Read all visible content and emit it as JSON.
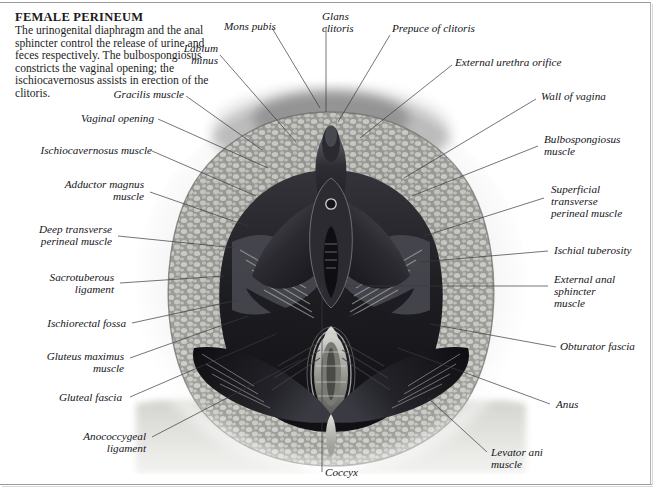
{
  "document": {
    "title": "FEMALE PERINEUM",
    "description": "The urinogenital diaphragm and the anal sphincter control the release of urine and feces respectively. The bulbospongiosus constricts the vaginal opening; the ischiocavernosus assists in erection of the clitoris."
  },
  "illustration": {
    "name": "female-perineum-anatomical-engraving",
    "style": "grayscale-engraving",
    "colors": {
      "ink_dark": "#1b1b1f",
      "mid_gray": "#7d7d82",
      "light_gray": "#c9c9c6",
      "paper": "#ffffff",
      "leader_line": "#3a3a40"
    }
  },
  "labels": [
    {
      "id": "mons-pubis",
      "text": "Mons pubis",
      "align": "l"
    },
    {
      "id": "glans-clitoris",
      "text": "Glans\nclitoris",
      "align": "l"
    },
    {
      "id": "prepuce-of-clitoris",
      "text": "Prepuce of clitoris",
      "align": "l"
    },
    {
      "id": "labium-minus",
      "text": "Labium\nminus",
      "align": "r"
    },
    {
      "id": "external-urethra-orifice",
      "text": "External urethra orifice",
      "align": "l"
    },
    {
      "id": "gracilis-muscle",
      "text": "Gracilis muscle",
      "align": "r"
    },
    {
      "id": "wall-of-vagina",
      "text": "Wall of vagina",
      "align": "l"
    },
    {
      "id": "vaginal-opening",
      "text": "Vaginal opening",
      "align": "r"
    },
    {
      "id": "bulbospongiosus-muscle",
      "text": "Bulbospongiosus\nmuscle",
      "align": "l"
    },
    {
      "id": "ischiocavernosus-muscle",
      "text": "Ischiocavernosus muscle",
      "align": "r"
    },
    {
      "id": "adductor-magnus-muscle",
      "text": "Adductor magnus\nmuscle",
      "align": "r"
    },
    {
      "id": "superficial-transverse-perineal-muscle",
      "text": "Superficial\ntransverse\nperineal muscle",
      "align": "l"
    },
    {
      "id": "deep-transverse-perineal-muscle",
      "text": "Deep transverse\nperineal muscle",
      "align": "r"
    },
    {
      "id": "ischial-tuberosity",
      "text": "Ischial tuberosity",
      "align": "l"
    },
    {
      "id": "sacrotuberous-ligament",
      "text": "Sacrotuberous\nligament",
      "align": "r"
    },
    {
      "id": "external-anal-sphincter-muscle",
      "text": "External anal\nsphincter\nmuscle",
      "align": "l"
    },
    {
      "id": "ischiorectal-fossa",
      "text": "Ischiorectal fossa",
      "align": "r"
    },
    {
      "id": "gluteus-maximus-muscle",
      "text": "Gluteus maximus\nmuscle",
      "align": "r"
    },
    {
      "id": "obturator-fascia",
      "text": "Obturator fascia",
      "align": "l"
    },
    {
      "id": "gluteal-fascia",
      "text": "Gluteal fascia",
      "align": "r"
    },
    {
      "id": "anus",
      "text": "Anus",
      "align": "l"
    },
    {
      "id": "anococcygeal-ligament",
      "text": "Anococcygeal\nligament",
      "align": "r"
    },
    {
      "id": "levator-ani-muscle",
      "text": "Levator ani\nmuscle",
      "align": "l"
    },
    {
      "id": "coccyx",
      "text": "Coccyx",
      "align": "l"
    }
  ]
}
